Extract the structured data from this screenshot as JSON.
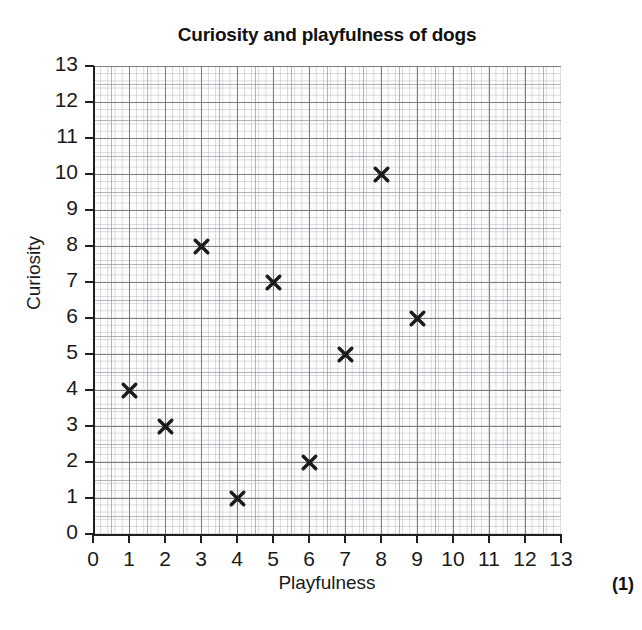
{
  "chart_data": {
    "type": "scatter",
    "title": "Curiosity and playfulness of dogs",
    "xlabel": "Playfulness",
    "ylabel": "Curiosity",
    "xlim": [
      0,
      13
    ],
    "ylim": [
      0,
      13
    ],
    "xticks": [
      0,
      1,
      2,
      3,
      4,
      5,
      6,
      7,
      8,
      9,
      10,
      11,
      12,
      13
    ],
    "yticks": [
      0,
      1,
      2,
      3,
      4,
      5,
      6,
      7,
      8,
      9,
      10,
      11,
      12,
      13
    ],
    "grid": true,
    "grid_style": "graph-paper-minor-5-per-unit",
    "legend": null,
    "marker": "x",
    "marker_color": "#1a1a1a",
    "points": [
      {
        "x": 1,
        "y": 4
      },
      {
        "x": 2,
        "y": 3
      },
      {
        "x": 3,
        "y": 8
      },
      {
        "x": 4,
        "y": 1
      },
      {
        "x": 5,
        "y": 7
      },
      {
        "x": 6,
        "y": 2
      },
      {
        "x": 7,
        "y": 5
      },
      {
        "x": 8,
        "y": 10
      },
      {
        "x": 9,
        "y": 6
      }
    ],
    "x": [
      1,
      2,
      3,
      4,
      5,
      6,
      7,
      8,
      9
    ],
    "y": [
      4,
      3,
      8,
      1,
      7,
      2,
      5,
      10,
      6
    ]
  },
  "annotations": {
    "marks": "(1)"
  }
}
